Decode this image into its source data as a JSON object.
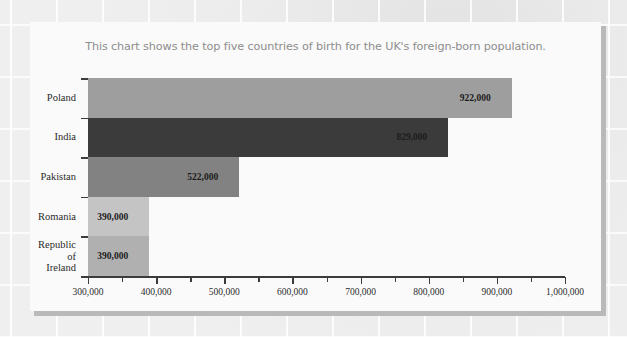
{
  "chart_data": {
    "type": "bar",
    "orientation": "horizontal",
    "title": "This chart shows the top five countries of birth for the UK's foreign-born population.",
    "xlabel": "",
    "ylabel": "",
    "categories": [
      "Poland",
      "India",
      "Pakistan",
      "Romania",
      "Republic of\nIreland"
    ],
    "values": [
      922000,
      829000,
      522000,
      390000,
      390000
    ],
    "value_labels": [
      "922,000",
      "829,000",
      "522,000",
      "390,000",
      "390,000"
    ],
    "bar_colors": [
      "#9e9e9e",
      "#3b3b3b",
      "#828282",
      "#c4c4c4",
      "#b0b0b0"
    ],
    "xlim": [
      300000,
      1000000
    ],
    "xticks": [
      300000,
      400000,
      500000,
      600000,
      700000,
      800000,
      900000,
      1000000
    ],
    "xtick_labels": [
      "300,000",
      "400,000",
      "500,000",
      "600,000",
      "700,000",
      "800,000",
      "900,000",
      "1,000,000"
    ],
    "minor_xticks": [
      350000,
      450000,
      550000,
      650000,
      750000,
      850000,
      950000
    ],
    "grid": false,
    "legend": false
  },
  "colors": {
    "card_background": "#fafafa",
    "page_background": "#ececec",
    "axis": "#3c3c3c",
    "title_text": "#8d8d8d",
    "label_text": "#2b2b2b",
    "shadow": "#b9b9b9"
  }
}
